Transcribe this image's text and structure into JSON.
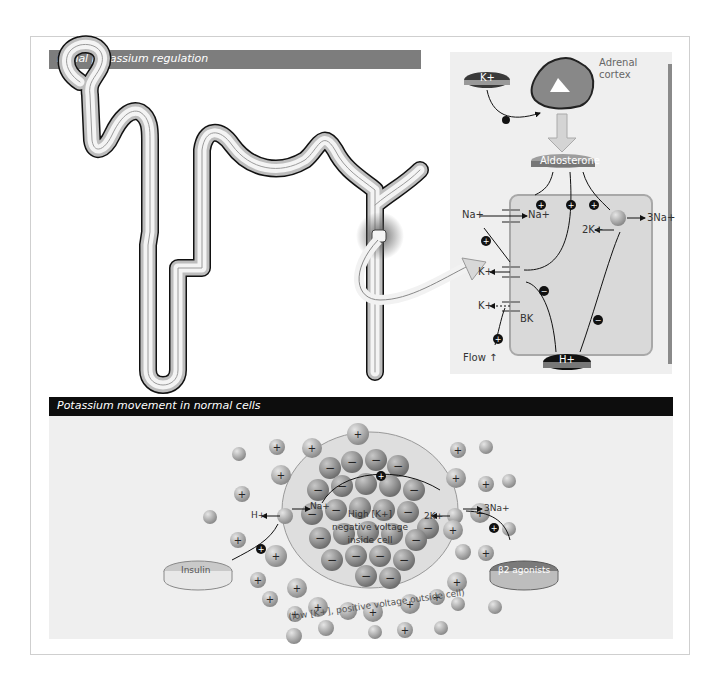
{
  "figure": {
    "top_panel": {
      "title": "Renal potassium regulation",
      "labels": {
        "k_plus": "K+",
        "adrenal_cortex": "Adrenal cortex",
        "aldosterone": "Aldosterone",
        "na_lumen": "Na+",
        "na_cell": "Na+",
        "three_na": "3Na+",
        "two_k": "2K+",
        "k_lumen_1": "K+",
        "k_lumen_2": "K+",
        "bk": "BK",
        "flow": "Flow ↑",
        "h_plus": "H+"
      }
    },
    "bottom_panel": {
      "title": "Potassium movement in normal cells",
      "labels": {
        "h_plus": "H+",
        "na_plus": "Na+",
        "three_na": "3Na+",
        "two_k": "2K+",
        "inside_line1": "High [K+]",
        "inside_line2": "negative voltage",
        "inside_line3": "inside cell",
        "insulin": "Insulin",
        "beta2": "β2 agonists",
        "outside": "(low [K+], positive voltage outside cell)"
      }
    },
    "colors": {
      "header_top": "#7d7d7d",
      "header_bottom": "#0d0d0d",
      "panel_bg": "#efefef",
      "ion": "#9a9a9a",
      "cell": "#d6d6d6"
    }
  }
}
